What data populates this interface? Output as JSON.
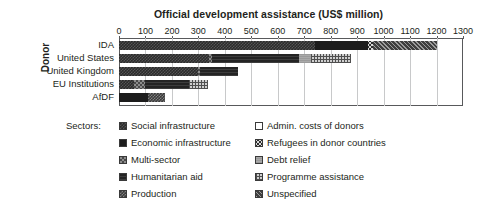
{
  "chart_data": {
    "type": "bar",
    "orientation": "horizontal",
    "stacked": true,
    "title": "Official development assistance (US$ million)",
    "xlabel": "Official development assistance (US$ million)",
    "ylabel": "Donor",
    "xlim": [
      0,
      1300
    ],
    "xticks": [
      0,
      100,
      200,
      300,
      400,
      500,
      600,
      700,
      800,
      900,
      1000,
      1100,
      1200,
      1300
    ],
    "xticklabels": [
      "0",
      "100",
      "200",
      "300",
      "400",
      "500",
      "600",
      "700",
      "800",
      "900",
      "1000",
      "1100",
      "1200",
      "1300"
    ],
    "grid": true,
    "grid_axis": "x",
    "legend_title": "Sectors:",
    "legend_position": "below",
    "categories": [
      "IDA",
      "United States",
      "United Kingdom",
      "EU Institutions",
      "AfDF"
    ],
    "series": [
      {
        "name": "Social infrastructure",
        "key": "social",
        "pattern": "p-social",
        "values": [
          740,
          340,
          300,
          55,
          0
        ]
      },
      {
        "name": "Economic infrastructure",
        "key": "economic",
        "pattern": "p-economic",
        "values": [
          200,
          0,
          0,
          0,
          110
        ]
      },
      {
        "name": "Multi-sector",
        "key": "multi",
        "pattern": "p-multi",
        "values": [
          0,
          10,
          8,
          45,
          0
        ]
      },
      {
        "name": "Humanitarian aid",
        "key": "humanitarian",
        "pattern": "p-humanitarian",
        "values": [
          0,
          330,
          140,
          165,
          0
        ]
      },
      {
        "name": "Production",
        "key": "production",
        "pattern": "p-production",
        "values": [
          0,
          0,
          0,
          0,
          65
        ]
      },
      {
        "name": "Admin. costs of donors",
        "key": "admin",
        "pattern": "p-admin",
        "values": [
          0,
          0,
          0,
          0,
          0
        ]
      },
      {
        "name": "Refugees in donor countries",
        "key": "refugees",
        "pattern": "p-refugees",
        "values": [
          20,
          0,
          0,
          0,
          0
        ]
      },
      {
        "name": "Debt relief",
        "key": "debt",
        "pattern": "p-debt",
        "values": [
          0,
          45,
          0,
          0,
          0
        ]
      },
      {
        "name": "Programme assistance",
        "key": "programme",
        "pattern": "p-programme",
        "values": [
          0,
          150,
          0,
          70,
          0
        ]
      },
      {
        "name": "Unspecified",
        "key": "unspecified",
        "pattern": "p-unspecified",
        "values": [
          240,
          0,
          0,
          0,
          0
        ]
      }
    ],
    "totals": [
      1200,
      875,
      448,
      335,
      175
    ],
    "bars": [
      {
        "category": "IDA",
        "total": 1200,
        "segments": [
          {
            "series": "Social infrastructure",
            "pattern": "p-social",
            "value": 740
          },
          {
            "series": "Economic infrastructure",
            "pattern": "p-economic",
            "value": 200
          },
          {
            "series": "Refugees in donor countries",
            "pattern": "p-refugees",
            "value": 20
          },
          {
            "series": "Economic infrastructure",
            "pattern": "p-economic",
            "value": 0
          },
          {
            "series": "Unspecified",
            "pattern": "p-unspecified",
            "value": 240
          }
        ]
      },
      {
        "category": "United States",
        "total": 875,
        "segments": [
          {
            "series": "Social infrastructure",
            "pattern": "p-social",
            "value": 340
          },
          {
            "series": "Multi-sector",
            "pattern": "p-multi",
            "value": 10
          },
          {
            "series": "Humanitarian aid",
            "pattern": "p-humanitarian",
            "value": 330
          },
          {
            "series": "Debt relief",
            "pattern": "p-debt",
            "value": 45
          },
          {
            "series": "Programme assistance",
            "pattern": "p-programme",
            "value": 150
          }
        ]
      },
      {
        "category": "United Kingdom",
        "total": 448,
        "segments": [
          {
            "series": "Social infrastructure",
            "pattern": "p-social",
            "value": 300
          },
          {
            "series": "Multi-sector",
            "pattern": "p-multi",
            "value": 8
          },
          {
            "series": "Humanitarian aid",
            "pattern": "p-humanitarian",
            "value": 140
          }
        ]
      },
      {
        "category": "EU Institutions",
        "total": 335,
        "segments": [
          {
            "series": "Social infrastructure",
            "pattern": "p-social",
            "value": 55
          },
          {
            "series": "Multi-sector",
            "pattern": "p-multi",
            "value": 45
          },
          {
            "series": "Humanitarian aid",
            "pattern": "p-humanitarian",
            "value": 165
          },
          {
            "series": "Programme assistance",
            "pattern": "p-programme",
            "value": 70
          }
        ]
      },
      {
        "category": "AfDF",
        "total": 175,
        "segments": [
          {
            "series": "Economic infrastructure",
            "pattern": "p-economic",
            "value": 110
          },
          {
            "series": "Production",
            "pattern": "p-production",
            "value": 65
          }
        ]
      }
    ]
  },
  "legend": {
    "title": "Sectors:",
    "column_left": [
      {
        "label": "Social infrastructure",
        "pattern": "p-social"
      },
      {
        "label": "Economic infrastructure",
        "pattern": "p-economic"
      },
      {
        "label": "Multi-sector",
        "pattern": "p-multi"
      },
      {
        "label": "Humanitarian aid",
        "pattern": "p-humanitarian"
      },
      {
        "label": "Production",
        "pattern": "p-production"
      }
    ],
    "column_right": [
      {
        "label": "Admin. costs of donors",
        "pattern": "p-admin"
      },
      {
        "label": "Refugees in donor countries",
        "pattern": "p-refugees"
      },
      {
        "label": "Debt relief",
        "pattern": "p-debt"
      },
      {
        "label": "Programme assistance",
        "pattern": "p-programme"
      },
      {
        "label": "Unspecified",
        "pattern": "p-unspecified"
      }
    ]
  },
  "colors": {
    "text": "#231f20",
    "axis": "#58595b",
    "grid": "#c8c9ca",
    "background": "#ffffff"
  }
}
